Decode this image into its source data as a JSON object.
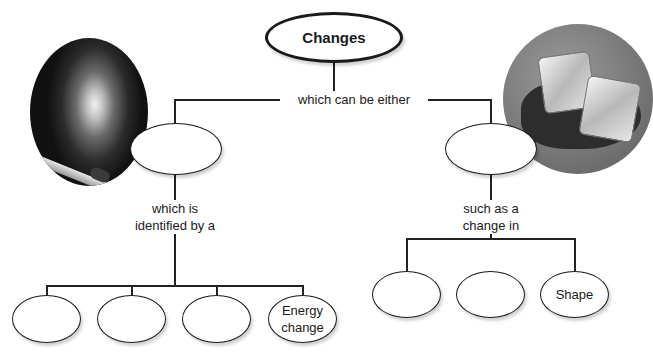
{
  "diagram": {
    "type": "concept-map",
    "root": {
      "label": "Changes"
    },
    "root_link": "which can be either",
    "left_branch": {
      "label": "",
      "link": "which is\nidentified by a",
      "link_lines": [
        "which is",
        "identified by a"
      ],
      "children": [
        {
          "label": ""
        },
        {
          "label": ""
        },
        {
          "label": ""
        },
        {
          "label": "Energy change",
          "lines": [
            "Energy",
            "change"
          ]
        }
      ]
    },
    "right_branch": {
      "label": "",
      "link": "such as a\nchange in",
      "link_lines": [
        "such as a",
        "change in"
      ],
      "children": [
        {
          "label": ""
        },
        {
          "label": ""
        },
        {
          "label": "Shape"
        }
      ]
    },
    "images": [
      {
        "name": "burning-match-photo",
        "position": "top-left"
      },
      {
        "name": "melting-ice-cubes-photo",
        "position": "top-right"
      }
    ]
  }
}
